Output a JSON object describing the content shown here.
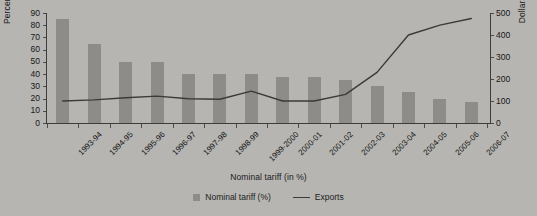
{
  "chart_data": {
    "type": "bar",
    "title": "",
    "xlabel": "Nominal tariff (in %)",
    "ylabel": "Percent",
    "y2label": "Dollars (millions)",
    "grid": false,
    "legend_position": "bottom",
    "categories": [
      "1993-94",
      "1994-95",
      "1995-96",
      "1996-97",
      "1997-98",
      "1998-99",
      "1999-2000",
      "2000-01",
      "2001-02",
      "2002-03",
      "2003-04",
      "2004-05",
      "2005-06",
      "2006-07"
    ],
    "ylim": [
      0,
      90
    ],
    "yticks": [
      0,
      10,
      20,
      30,
      40,
      50,
      60,
      70,
      80,
      90
    ],
    "y2lim": [
      0,
      500
    ],
    "y2ticks": [
      0,
      100,
      200,
      300,
      400,
      500
    ],
    "series": [
      {
        "name": "Nominal tariff (%)",
        "type": "bar",
        "axis": "left",
        "color": "#8d8c89",
        "values": [
          85,
          65,
          50,
          50,
          40,
          40,
          40,
          38,
          38,
          35,
          30,
          25,
          20,
          17
        ]
      },
      {
        "name": "Exports",
        "type": "line",
        "axis": "right",
        "color": "#3a3a3a",
        "values": [
          100,
          105,
          115,
          122,
          110,
          108,
          145,
          100,
          100,
          130,
          230,
          400,
          445,
          475
        ]
      }
    ]
  },
  "axes": {
    "left_title": "Percent",
    "right_title": "Dollars (millions)",
    "x_title": "Nominal tariff (in %)",
    "left_ticks": [
      "90",
      "80",
      "70",
      "60",
      "50",
      "40",
      "30",
      "20",
      "10",
      "0"
    ],
    "right_ticks": [
      "500",
      "400",
      "300",
      "200",
      "100",
      "0"
    ]
  },
  "legend": {
    "items": [
      {
        "label": "Nominal tariff (%)",
        "marker": "square-swatch"
      },
      {
        "label": "Exports",
        "marker": "line-swatch"
      }
    ]
  },
  "colors": {
    "background": "#b6b5b2",
    "bar": "#8d8c89",
    "line": "#3a3a3a",
    "axis": "#3c3c3c",
    "text": "#171717"
  }
}
